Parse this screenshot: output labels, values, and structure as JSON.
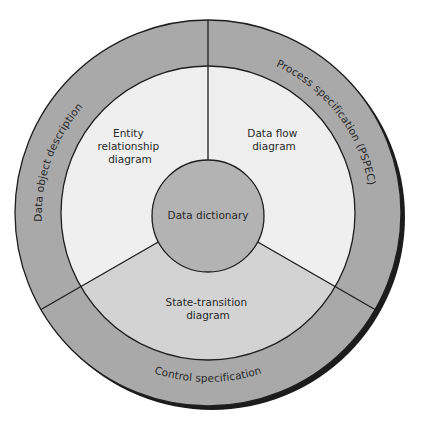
{
  "diagram": {
    "type": "concentric-ring-diagram",
    "center_label": "Data dictionary",
    "inner_sectors": [
      {
        "id": "entity-relationship",
        "lines": [
          "Entity",
          "relationship",
          "diagram"
        ],
        "position": "upper-left"
      },
      {
        "id": "data-flow",
        "lines": [
          "Data flow",
          "diagram"
        ],
        "position": "upper-right"
      },
      {
        "id": "state-transition",
        "lines": [
          "State-transition",
          "diagram"
        ],
        "position": "bottom"
      }
    ],
    "outer_ring": [
      {
        "id": "data-object-description",
        "label": "Data object description",
        "position": "left"
      },
      {
        "id": "process-specification",
        "label": "Process specification (PSPEC)",
        "position": "right"
      },
      {
        "id": "control-specification",
        "label": "Control specification",
        "position": "bottom"
      }
    ],
    "colors": {
      "outer_ring": "#a9a9a9",
      "light_sector": "#efefef",
      "bottom_sector": "#d3d3d3",
      "center_circle": "#b3b3b3",
      "stroke": "#1e1e1e",
      "shadow": "#1c1c1c"
    }
  }
}
